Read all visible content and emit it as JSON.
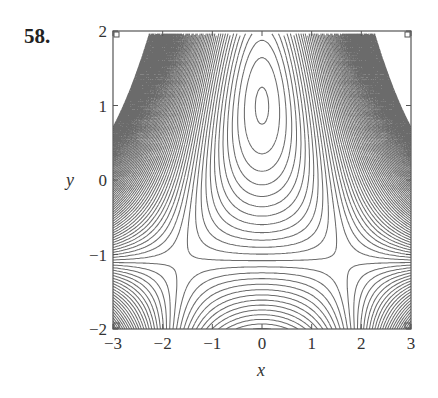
{
  "problem_label": "58.",
  "chart_data": {
    "type": "contour",
    "title": "",
    "xlabel": "x",
    "ylabel": "y",
    "xlim": [
      -3,
      3
    ],
    "ylim": [
      -2,
      2
    ],
    "x_ticks": [
      -3,
      -2,
      -1,
      0,
      1,
      2,
      3
    ],
    "y_ticks": [
      -2,
      -1,
      0,
      1,
      2
    ],
    "x_tick_labels": [
      "−3",
      "−2",
      "−1",
      "0",
      "1",
      "2",
      "3"
    ],
    "y_tick_labels": [
      "−2",
      "−1",
      "0",
      "1",
      "2"
    ],
    "grid": false,
    "legend": null,
    "features": {
      "closed_contours_center": [
        0,
        1
      ],
      "saddle_points": [
        [
          -1.6,
          -1.1
        ],
        [
          1.6,
          -1.1
        ]
      ],
      "dense_region_clip_polygon": [
        [
          -3,
          1
        ],
        [
          -2.3,
          1.95
        ],
        [
          2.3,
          1.95
        ],
        [
          3,
          1
        ]
      ]
    },
    "model_function": "f(x,y) = (y+1.1)*(x^2 - 2.6 + 0.62*(y+1.1))",
    "contour_levels": {
      "start": -6.0,
      "step": 0.22,
      "count": 90
    },
    "line_color": "#6b6b6b"
  },
  "plot_area": {
    "left": 113,
    "top": 31,
    "right": 411,
    "bottom": 329
  }
}
